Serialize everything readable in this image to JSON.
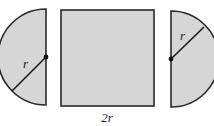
{
  "diagram": {
    "colors": {
      "fill": "#d6d6d6",
      "stroke": "#2a2a2a",
      "background": "#ffffff"
    },
    "left_semicircle": {
      "radius_label": "r"
    },
    "square": {
      "side_label": "2r"
    },
    "right_semicircle": {
      "radius_label": "r"
    }
  }
}
